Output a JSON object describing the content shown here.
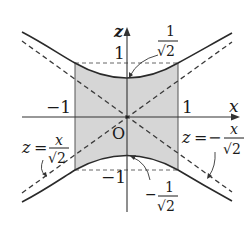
{
  "figure": {
    "colors": {
      "curve": "#2a2a2a",
      "dashed": "#3a3a3a",
      "axis": "#333333",
      "shade": "#d6d6d6",
      "text": "#1a1a1a"
    },
    "axes": {
      "x_label": "x",
      "z_label": "z",
      "origin_label": "O"
    },
    "ticks": {
      "x_neg": "−1",
      "x_pos": "1",
      "z_pos": "1",
      "z_neg": "−1"
    },
    "annotations": {
      "top_vertex": {
        "sign": "",
        "numerator": "1",
        "denominator": "√2"
      },
      "bottom_vertex": {
        "sign": "−",
        "numerator": "1",
        "denominator": "√2"
      },
      "asymptote_left": {
        "lhs": "z",
        "eq": "=",
        "sign": "",
        "numerator": "x",
        "denominator": "√2"
      },
      "asymptote_right": {
        "lhs": "z",
        "eq": "=",
        "sign": "−",
        "numerator": "x",
        "denominator": "√2"
      }
    }
  }
}
